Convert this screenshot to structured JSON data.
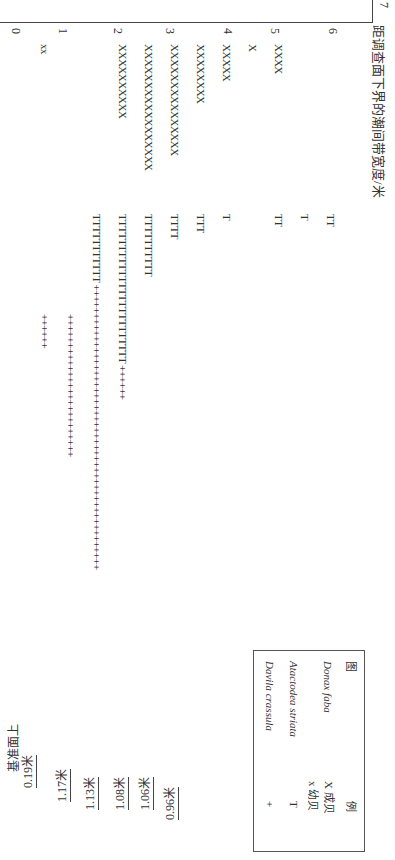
{
  "axis": {
    "title": "距调查面下界的潮间带宽度/米",
    "ticks": [
      "7",
      "6",
      "5",
      "4",
      "3",
      "2",
      "1",
      "0"
    ]
  },
  "datum": {
    "label": "基准面上",
    "levels": [
      "0.19米",
      "1.17米",
      "1.13米",
      "1.08米",
      "1.06米",
      "0.96米"
    ]
  },
  "rows": [
    {
      "x": "",
      "t": "TT",
      "p": ""
    },
    {
      "x": "",
      "t": "T",
      "p": ""
    },
    {
      "x": "XXXX",
      "t": "TT",
      "p": ""
    },
    {
      "x": "X",
      "t": "",
      "p": ""
    },
    {
      "x": "XXXXX",
      "t": "T",
      "p": ""
    },
    {
      "x": "XXXXXXXX",
      "t": "TTT",
      "p": ""
    },
    {
      "x": "XXXXXXXXXXXXXXX",
      "t": "TTTT",
      "p": ""
    },
    {
      "x": "XXXXXXXXXXXXXXXXX",
      "t": "TTTTTTTTTT",
      "p": ""
    },
    {
      "x": "XXXXXXXXXX",
      "t": "TTTTTTTTTTTTTTTTTTTTTTTT",
      "p": "++++++"
    },
    {
      "x": "",
      "t": "TTTTTTTTTTT",
      "p": "++++++++++++++++++++++++++++++++++++++++++++++++++"
    },
    {
      "x": "",
      "t": "",
      "p": "+++++++++++++++++++++++++"
    },
    {
      "x": "xx",
      "t": "",
      "p": "++++++"
    }
  ],
  "legend": {
    "title_left": "图",
    "title_right": "例",
    "entries": [
      {
        "species": "Donax faba",
        "symbols": [
          "X 成贝",
          "x 幼贝"
        ]
      },
      {
        "species": "Atactodea striata",
        "symbols": [
          "T"
        ]
      },
      {
        "species": "Davila crassula",
        "symbols": [
          "+"
        ]
      }
    ]
  }
}
